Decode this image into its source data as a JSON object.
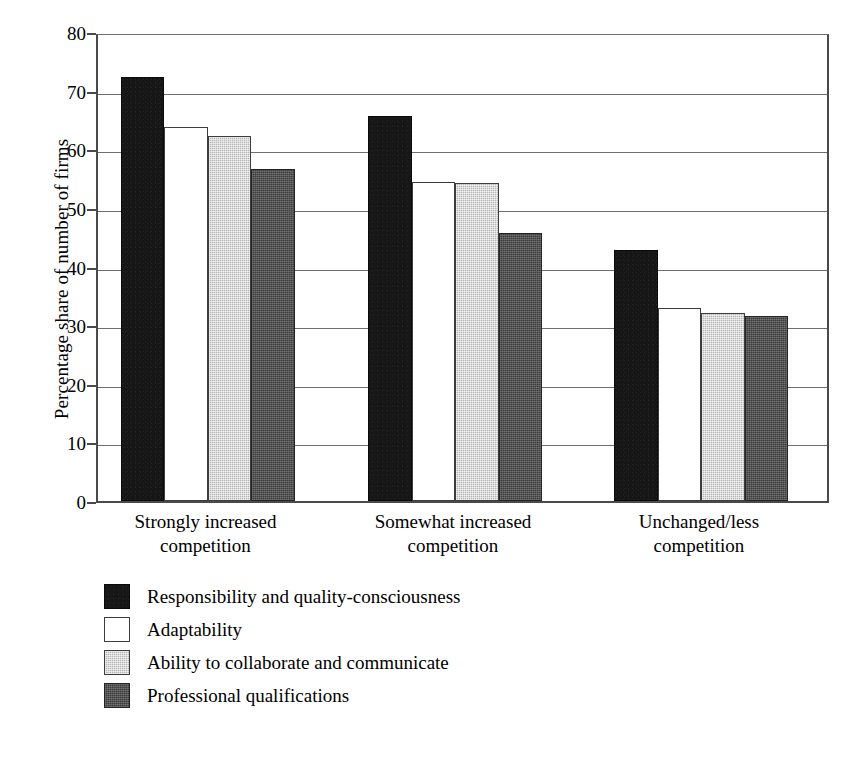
{
  "chart_data": {
    "type": "bar",
    "title": "",
    "subtitle": "",
    "xlabel": "",
    "ylabel": "Percentage share of number of firms",
    "ylim": [
      0,
      80
    ],
    "y_ticks": [
      0,
      10,
      20,
      30,
      40,
      50,
      60,
      70,
      80
    ],
    "grid": true,
    "legend_position": "below-plot-left",
    "categories": [
      "Strongly increased competition",
      "Somewhat increased competition",
      "Unchanged/less competition"
    ],
    "category_lines": [
      [
        "Strongly increased",
        "competition"
      ],
      [
        "Somewhat increased",
        "competition"
      ],
      [
        "Unchanged/less",
        "competition"
      ]
    ],
    "series": [
      {
        "name": "Responsibility and quality-consciousness",
        "color": "#161616",
        "swatch": "swatch-black",
        "values": [
          72.4,
          65.7,
          42.8
        ]
      },
      {
        "name": "Adaptability",
        "color": "#ffffff",
        "swatch": "swatch-white",
        "values": [
          63.8,
          54.5,
          32.9
        ]
      },
      {
        "name": "Ability to collaborate and communicate",
        "color": "#b7b7b7",
        "swatch": "swatch-gray",
        "values": [
          62.2,
          54.3,
          32.1
        ]
      },
      {
        "name": "Professional qualifications",
        "color": "#3c3c3c",
        "swatch": "swatch-darkgray",
        "values": [
          56.6,
          45.8,
          31.5
        ]
      }
    ]
  }
}
